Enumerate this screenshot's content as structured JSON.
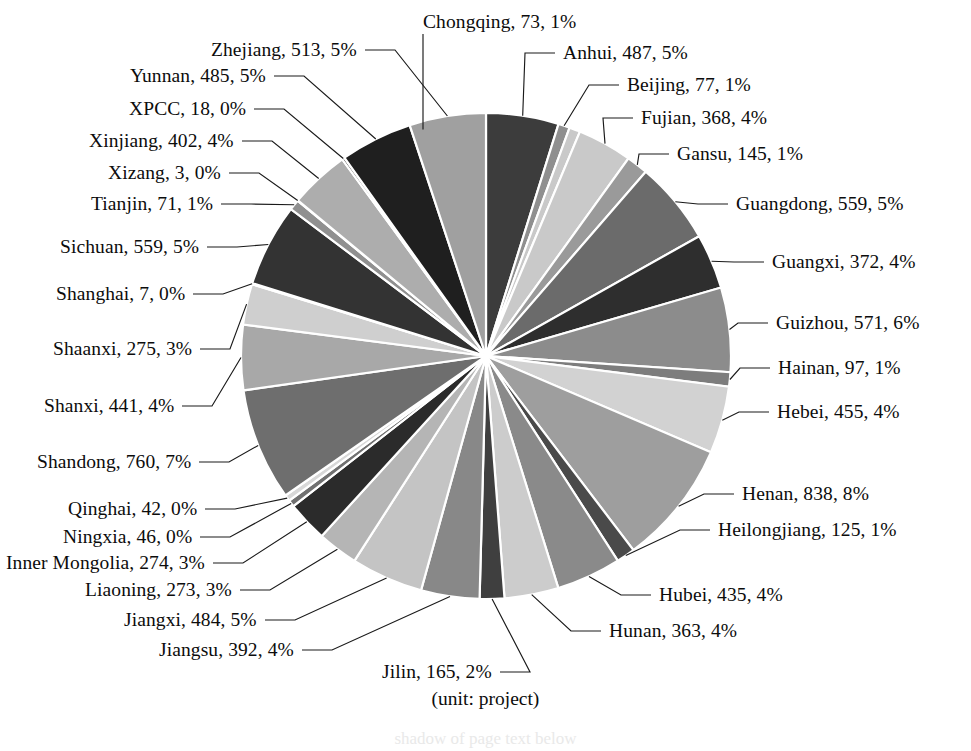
{
  "caption": "(unit: project)",
  "chart_data": {
    "type": "pie",
    "title": "",
    "subtitle": "",
    "xlabel": "",
    "ylabel": "",
    "unit": "project",
    "legend_position": "callout-labels",
    "label_format": "name, value, percent",
    "grid": false,
    "total": 10646,
    "start_angle_deg": 0,
    "direction": "clockwise",
    "categories": [
      "Anhui",
      "Beijing",
      "Chongqing",
      "Fujian",
      "Gansu",
      "Guangdong",
      "Guangxi",
      "Guizhou",
      "Hainan",
      "Hebei",
      "Henan",
      "Heilongjiang",
      "Hubei",
      "Hunan",
      "Jiangsu",
      "Jiangxi",
      "Jilin",
      "Liaoning",
      "Inner Mongolia",
      "Ningxia",
      "Qinghai",
      "Shandong",
      "Shanxi",
      "Shaanxi",
      "Shanghai",
      "Sichuan",
      "Tianjin",
      "Xizang",
      "Xinjiang",
      "XPCC",
      "Yunnan",
      "Zhejiang"
    ],
    "values": [
      487,
      77,
      73,
      368,
      145,
      559,
      372,
      571,
      97,
      455,
      838,
      125,
      435,
      363,
      392,
      484,
      165,
      273,
      274,
      46,
      42,
      760,
      441,
      275,
      7,
      559,
      71,
      3,
      402,
      18,
      485,
      513
    ],
    "percents": [
      5,
      1,
      1,
      4,
      1,
      5,
      4,
      6,
      1,
      4,
      8,
      1,
      4,
      4,
      4,
      5,
      2,
      3,
      3,
      0,
      0,
      7,
      4,
      3,
      0,
      5,
      1,
      0,
      4,
      0,
      5,
      5
    ],
    "colors": [
      "#3c3c3c",
      "#8f8f8f",
      "#c9c9c9",
      "#c9c9c9",
      "#9a9a9a",
      "#6b6b6b",
      "#2e2e2e",
      "#8c8c8c",
      "#7d7d7d",
      "#d2d2d2",
      "#9e9e9e",
      "#4a4a4a",
      "#8a8a8a",
      "#cccccc",
      "#3f3f3f",
      "#888888",
      "#c4c4c4",
      "#b5b5b5",
      "#2b2b2b",
      "#707070",
      "#d8d8d8",
      "#6e6e6e",
      "#a8a8a8",
      "#cfcfcf",
      "#5a5a5a",
      "#333333",
      "#909090",
      "#d4d4d4",
      "#adadad",
      "#4d4d4d",
      "#1f1f1f",
      "#a0a0a0"
    ],
    "slices": [
      {
        "name": "Anhui",
        "value": 487,
        "percent": 1,
        "label": "Anhui, 487, 5%"
      },
      {
        "name": "Beijing",
        "value": 77,
        "percent": 1,
        "label": "Beijing, 77, 1%"
      },
      {
        "name": "Chongqing",
        "value": 73,
        "percent": 1,
        "label": "Chongqing, 73, 1%"
      },
      {
        "name": "Fujian",
        "value": 368,
        "percent": 4,
        "label": "Fujian, 368, 4%"
      },
      {
        "name": "Gansu",
        "value": 145,
        "percent": 1,
        "label": "Gansu, 145, 1%"
      },
      {
        "name": "Guangdong",
        "value": 559,
        "percent": 5,
        "label": "Guangdong, 559, 5%"
      },
      {
        "name": "Guangxi",
        "value": 372,
        "percent": 4,
        "label": "Guangxi, 372, 4%"
      },
      {
        "name": "Guizhou",
        "value": 571,
        "percent": 6,
        "label": "Guizhou, 571, 6%"
      },
      {
        "name": "Hainan",
        "value": 97,
        "percent": 1,
        "label": "Hainan, 97, 1%"
      },
      {
        "name": "Hebei",
        "value": 455,
        "percent": 4,
        "label": "Hebei, 455, 4%"
      },
      {
        "name": "Henan",
        "value": 838,
        "percent": 8,
        "label": "Henan, 838, 8%"
      },
      {
        "name": "Heilongjiang",
        "value": 125,
        "percent": 1,
        "label": "Heilongjiang, 125, 1%"
      },
      {
        "name": "Hubei",
        "value": 435,
        "percent": 4,
        "label": "Hubei, 435, 4%"
      },
      {
        "name": "Hunan",
        "value": 363,
        "percent": 4,
        "label": "Hunan, 363, 4%"
      },
      {
        "name": "Jilin",
        "value": 165,
        "percent": 2,
        "label": "Jilin, 165, 2%"
      },
      {
        "name": "Jiangsu",
        "value": 392,
        "percent": 4,
        "label": "Jiangsu, 392, 4%"
      },
      {
        "name": "Jiangxi",
        "value": 484,
        "percent": 5,
        "label": "Jiangxi, 484, 5%"
      },
      {
        "name": "Liaoning",
        "value": 273,
        "percent": 3,
        "label": "Liaoning, 273, 3%"
      },
      {
        "name": "Inner Mongolia",
        "value": 274,
        "percent": 3,
        "label": "Inner Mongolia, 274, 3%"
      },
      {
        "name": "Ningxia",
        "value": 46,
        "percent": 0,
        "label": "Ningxia, 46, 0%"
      },
      {
        "name": "Qinghai",
        "value": 42,
        "percent": 0,
        "label": "Qinghai, 42, 0%"
      },
      {
        "name": "Shandong",
        "value": 760,
        "percent": 7,
        "label": "Shandong, 760, 7%"
      },
      {
        "name": "Shanxi",
        "value": 441,
        "percent": 4,
        "label": "Shanxi, 441, 4%"
      },
      {
        "name": "Shaanxi",
        "value": 275,
        "percent": 3,
        "label": "Shaanxi, 275, 3%"
      },
      {
        "name": "Shanghai",
        "value": 7,
        "percent": 0,
        "label": "Shanghai, 7, 0%"
      },
      {
        "name": "Sichuan",
        "value": 559,
        "percent": 5,
        "label": "Sichuan, 559, 5%"
      },
      {
        "name": "Tianjin",
        "value": 71,
        "percent": 1,
        "label": "Tianjin, 71, 1%"
      },
      {
        "name": "Xizang",
        "value": 3,
        "percent": 0,
        "label": "Xizang, 3, 0%"
      },
      {
        "name": "Xinjiang",
        "value": 402,
        "percent": 4,
        "label": "Xinjiang, 402, 4%"
      },
      {
        "name": "XPCC",
        "value": 18,
        "percent": 0,
        "label": "XPCC, 18, 0%"
      },
      {
        "name": "Yunnan",
        "value": 485,
        "percent": 5,
        "label": "Yunnan, 485, 5%"
      },
      {
        "name": "Zhejiang",
        "value": 513,
        "percent": 5,
        "label": "Zhejiang, 513, 5%"
      }
    ]
  },
  "labels": {
    "chongqing": {
      "text": "Chongqing, 73, 1%",
      "x": 423,
      "y": 12,
      "align": "center"
    },
    "zhejiang": {
      "text": "Zhejiang, 513, 5%",
      "x": 211,
      "y": 40,
      "align": "left"
    },
    "yunnan": {
      "text": "Yunnan, 485, 5%",
      "x": 130,
      "y": 66,
      "align": "left"
    },
    "xpcc": {
      "text": "XPCC, 18, 0%",
      "x": 129,
      "y": 99,
      "align": "left"
    },
    "xinjiang": {
      "text": "Xinjiang, 402, 4%",
      "x": 89,
      "y": 131,
      "align": "left"
    },
    "xizang": {
      "text": "Xizang, 3, 0%",
      "x": 108,
      "y": 163,
      "align": "left"
    },
    "tianjin": {
      "text": "Tianjin, 71, 1%",
      "x": 91,
      "y": 194,
      "align": "left"
    },
    "sichuan": {
      "text": "Sichuan, 559, 5%",
      "x": 60,
      "y": 237,
      "align": "left"
    },
    "shanghai": {
      "text": "Shanghai, 7, 0%",
      "x": 56,
      "y": 284,
      "align": "left"
    },
    "shaanxi": {
      "text": "Shaanxi, 275, 3%",
      "x": 53,
      "y": 339,
      "align": "left"
    },
    "shanxi": {
      "text": "Shanxi, 441, 4%",
      "x": 44,
      "y": 396,
      "align": "left"
    },
    "shandong": {
      "text": "Shandong, 760, 7%",
      "x": 37,
      "y": 452,
      "align": "left"
    },
    "qinghai": {
      "text": "Qinghai, 42, 0%",
      "x": 68,
      "y": 499,
      "align": "left"
    },
    "ningxia": {
      "text": "Ningxia, 46, 0%",
      "x": 63,
      "y": 527,
      "align": "left"
    },
    "inner_mongolia": {
      "text": "Inner Mongolia, 274, 3%",
      "x": 6,
      "y": 553,
      "align": "left"
    },
    "liaoning": {
      "text": "Liaoning, 273, 3%",
      "x": 85,
      "y": 580,
      "align": "left"
    },
    "jiangxi": {
      "text": "Jiangxi, 484, 5%",
      "x": 124,
      "y": 610,
      "align": "left"
    },
    "jiangsu": {
      "text": "Jiangsu, 392, 4%",
      "x": 159,
      "y": 640,
      "align": "left"
    },
    "jilin": {
      "text": "Jilin, 165, 2%",
      "x": 382,
      "y": 662,
      "align": "left"
    },
    "hunan": {
      "text": "Hunan, 363, 4%",
      "x": 609,
      "y": 621,
      "align": "left"
    },
    "hubei": {
      "text": "Hubei, 435, 4%",
      "x": 659,
      "y": 585,
      "align": "left"
    },
    "heilongjiang": {
      "text": "Heilongjiang, 125, 1%",
      "x": 718,
      "y": 520,
      "align": "left"
    },
    "henan": {
      "text": "Henan, 838, 8%",
      "x": 742,
      "y": 484,
      "align": "left"
    },
    "hebei": {
      "text": "Hebei, 455, 4%",
      "x": 777,
      "y": 402,
      "align": "left"
    },
    "hainan": {
      "text": "Hainan, 97, 1%",
      "x": 778,
      "y": 358,
      "align": "left"
    },
    "guizhou": {
      "text": "Guizhou, 571, 6%",
      "x": 776,
      "y": 313,
      "align": "left"
    },
    "guangxi": {
      "text": "Guangxi, 372, 4%",
      "x": 772,
      "y": 252,
      "align": "left"
    },
    "guangdong": {
      "text": "Guangdong, 559, 5%",
      "x": 736,
      "y": 194,
      "align": "left"
    },
    "gansu": {
      "text": "Gansu, 145, 1%",
      "x": 677,
      "y": 144,
      "align": "left"
    },
    "fujian": {
      "text": "Fujian, 368, 4%",
      "x": 641,
      "y": 108,
      "align": "left"
    },
    "beijing": {
      "text": "Beijing, 77, 1%",
      "x": 627,
      "y": 75,
      "align": "left"
    },
    "anhui": {
      "text": "Anhui, 487, 5%",
      "x": 563,
      "y": 43,
      "align": "left"
    }
  },
  "bleed_text": "shadow of page text below"
}
